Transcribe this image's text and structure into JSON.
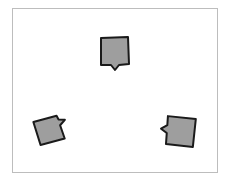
{
  "canvas": {
    "frame_color": "#bdbdbd",
    "background": "#ffffff"
  },
  "bubbles": [
    {
      "id": "top",
      "fill": "#9e9e9e",
      "stroke": "#1a1a1a",
      "tail": "bottom",
      "rotation": 0
    },
    {
      "id": "left",
      "fill": "#9e9e9e",
      "stroke": "#1a1a1a",
      "tail": "right",
      "rotation": -15
    },
    {
      "id": "right",
      "fill": "#9e9e9e",
      "stroke": "#1a1a1a",
      "tail": "left",
      "rotation": 5
    }
  ]
}
